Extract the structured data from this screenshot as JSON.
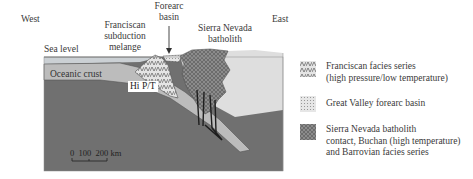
{
  "diagram": {
    "orientation": {
      "west": "West",
      "east": "East"
    },
    "labels": {
      "sea_level": "Sea level",
      "franciscan_line1": "Franciscan",
      "franciscan_line2": "subduction",
      "franciscan_line3": "melange",
      "forearc_line1": "Forearc",
      "forearc_line2": "basin",
      "batholith_line1": "Sierra Nevada",
      "batholith_line2": "batholith",
      "oceanic_crust": "Oceanic crust",
      "hi_pt": "Hi P/T"
    },
    "scale_bar": {
      "ticks": [
        "0",
        "100",
        "200 km"
      ]
    },
    "colors": {
      "sea": "#c9ced3",
      "oceanic_crust": "#bdbdbd",
      "mantle": "#6f6f6f",
      "continent": "#dcdcdc",
      "batholith": "#8a8a8a",
      "forearc": "#e2e2e2",
      "outline": "#555555"
    }
  },
  "legend": {
    "items": [
      {
        "swatch": "franciscan-pattern",
        "line1": "Franciscan facies series",
        "line2": "(high pressure/low temperature)",
        "line3": ""
      },
      {
        "swatch": "forearc-pattern",
        "line1": "Great Valley forearc basin",
        "line2": "",
        "line3": ""
      },
      {
        "swatch": "batholith-pattern",
        "line1": "Sierra Nevada batholith",
        "line2": "contact, Buchan (high temperature)",
        "line3": "and Barrovian facies series"
      }
    ]
  }
}
